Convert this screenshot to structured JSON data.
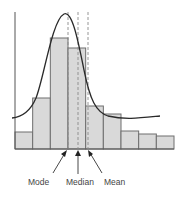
{
  "chart_data": {
    "type": "bar",
    "subtype": "histogram-with-density-curve",
    "title": "",
    "xlabel": "",
    "ylabel": "",
    "grid": false,
    "legend": null,
    "categories": [
      "1",
      "2",
      "3",
      "4",
      "5",
      "6",
      "7",
      "8",
      "9"
    ],
    "values": [
      17,
      51,
      111,
      101,
      43,
      35,
      18,
      15,
      13
    ],
    "ylim": [
      0,
      137
    ],
    "curve": {
      "name": "density curve",
      "shape": "right-skewed",
      "peak_bin_position": 2.9
    },
    "annotations": [
      {
        "label": "Mode",
        "x_position": 3.0,
        "style": "dashed"
      },
      {
        "label": "Median",
        "x_position": 3.55,
        "style": "dashed"
      },
      {
        "label": "Mean",
        "x_position": 4.1,
        "style": "dashed"
      }
    ]
  },
  "labels": {
    "mode": "Mode",
    "median": "Median",
    "mean": "Mean"
  },
  "colors": {
    "bar_fill": "#d9d9d9",
    "bar_stroke": "#6e6e6e",
    "curve": "#2a2a2a",
    "guide": "#8a8a8a"
  }
}
